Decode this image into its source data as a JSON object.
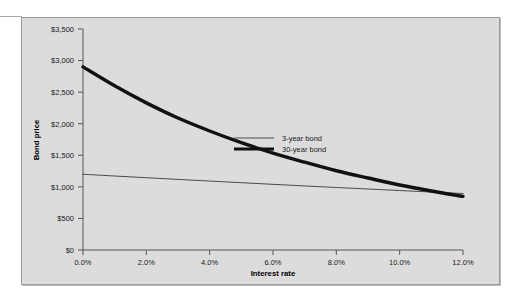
{
  "chart_data": {
    "type": "line",
    "title": "",
    "xlabel": "Interest rate",
    "ylabel": "Bond price",
    "xlim": [
      0,
      12
    ],
    "ylim": [
      0,
      3500
    ],
    "grid": false,
    "legend_position": "center-right-inside",
    "xticks": [
      "0.0%",
      "2.0%",
      "4.0%",
      "6.0%",
      "8.0%",
      "10.0%",
      "12.0%"
    ],
    "xtick_values": [
      0,
      2,
      4,
      6,
      8,
      10,
      12
    ],
    "yticks": [
      "$0",
      "$500",
      "$1,000",
      "$1,500",
      "$2,000",
      "$2,500",
      "$3,000",
      "$3,500"
    ],
    "ytick_values": [
      0,
      500,
      1000,
      1500,
      2000,
      2500,
      3000,
      3500
    ],
    "x": [
      0,
      1,
      2,
      3,
      4,
      5,
      6,
      7,
      8,
      9,
      10,
      11,
      12
    ],
    "series": [
      {
        "name": "3-year bond",
        "style": "thin",
        "color": "#4a4a4a",
        "width": 1,
        "values": [
          1200,
          1172,
          1145,
          1118,
          1092,
          1066,
          1040,
          1015,
          990,
          966,
          942,
          918,
          895
        ]
      },
      {
        "name": "30-year bond",
        "style": "thick",
        "color": "#111111",
        "width": 3.4,
        "values": [
          2900,
          2600,
          2330,
          2090,
          1885,
          1700,
          1535,
          1390,
          1255,
          1140,
          1030,
          935,
          850
        ]
      }
    ],
    "intersection": {
      "x": 6.1,
      "y": 1040
    },
    "legend": [
      {
        "label": "3-year bond",
        "swatch": "thin-line"
      },
      {
        "label": "30-year bond",
        "swatch": "thick-line"
      }
    ]
  },
  "colors": {
    "panel_background": "#dcdcdc",
    "panel_border": "#9a9a9a",
    "axis": "#555555",
    "thin_series": "#4a4a4a",
    "thick_series": "#111111",
    "text": "#1a1a1a"
  }
}
